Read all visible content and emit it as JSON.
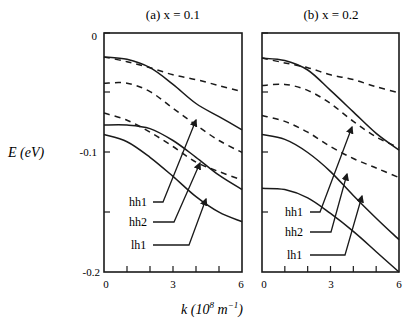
{
  "chart_data": [
    {
      "type": "line",
      "title": "(a) x = 0.1",
      "xlabel": "k (10^8 m^-1)",
      "ylabel": "E (eV)",
      "xlim": [
        0,
        6
      ],
      "ylim": [
        -0.2,
        0
      ],
      "x": [
        0,
        1,
        2,
        3,
        4,
        5,
        6
      ],
      "series": [
        {
          "name": "hh1",
          "style": "solid",
          "values": [
            -0.02,
            -0.022,
            -0.029,
            -0.043,
            -0.059,
            -0.07,
            -0.081
          ]
        },
        {
          "name": "hh2",
          "style": "solid",
          "values": [
            -0.077,
            -0.077,
            -0.08,
            -0.09,
            -0.104,
            -0.119,
            -0.131
          ]
        },
        {
          "name": "lh1",
          "style": "solid",
          "values": [
            -0.085,
            -0.091,
            -0.104,
            -0.12,
            -0.137,
            -0.15,
            -0.158
          ]
        },
        {
          "name": "dashed-1",
          "style": "dashed",
          "values": [
            -0.02,
            -0.024,
            -0.029,
            -0.035,
            -0.039,
            -0.044,
            -0.049
          ]
        },
        {
          "name": "dashed-2",
          "style": "dashed",
          "values": [
            -0.042,
            -0.042,
            -0.049,
            -0.063,
            -0.077,
            -0.09,
            -0.1
          ]
        },
        {
          "name": "dashed-3",
          "style": "dashed",
          "values": [
            -0.067,
            -0.073,
            -0.083,
            -0.095,
            -0.108,
            -0.116,
            -0.123
          ]
        }
      ]
    },
    {
      "type": "line",
      "title": "(b) x = 0.2",
      "xlabel": "k (10^8 m^-1)",
      "ylabel": "E (eV)",
      "xlim": [
        0,
        6
      ],
      "ylim": [
        -0.2,
        0
      ],
      "x": [
        0,
        1,
        2,
        3,
        4,
        5,
        6
      ],
      "series": [
        {
          "name": "hh1",
          "style": "solid",
          "values": [
            -0.021,
            -0.023,
            -0.031,
            -0.048,
            -0.066,
            -0.084,
            -0.098
          ]
        },
        {
          "name": "hh2",
          "style": "solid",
          "values": [
            -0.085,
            -0.089,
            -0.1,
            -0.116,
            -0.136,
            -0.155,
            -0.173
          ]
        },
        {
          "name": "lh1",
          "style": "solid",
          "values": [
            -0.13,
            -0.131,
            -0.138,
            -0.151,
            -0.166,
            -0.183,
            -0.2
          ]
        },
        {
          "name": "dashed-1",
          "style": "dashed",
          "values": [
            -0.021,
            -0.025,
            -0.029,
            -0.035,
            -0.039,
            -0.045,
            -0.05
          ]
        },
        {
          "name": "dashed-2",
          "style": "dashed",
          "values": [
            -0.044,
            -0.043,
            -0.048,
            -0.059,
            -0.074,
            -0.087,
            -0.096
          ]
        },
        {
          "name": "dashed-3",
          "style": "dashed",
          "values": [
            -0.069,
            -0.074,
            -0.083,
            -0.095,
            -0.105,
            -0.113,
            -0.121
          ]
        }
      ]
    }
  ],
  "labels": {
    "panel_a_title": "(a) x = 0.1",
    "panel_b_title": "(b) x = 0.2",
    "ylabel": "E (eV)",
    "xlabel": "k (10",
    "xlabel_exp": "8",
    "xlabel_unit": " m",
    "xlabel_unit_exp": "−1",
    "xlabel_close": ")",
    "ytick_0": "0",
    "ytick_1": "-0.1",
    "ytick_2": "-0.2",
    "xtick_0": "0",
    "xtick_3": "3",
    "xtick_6": "6",
    "hh1": "hh1",
    "hh2": "hh2",
    "lh1": "lh1"
  },
  "colors": {
    "ink": "#1a1a1a",
    "background": "#ffffff"
  }
}
